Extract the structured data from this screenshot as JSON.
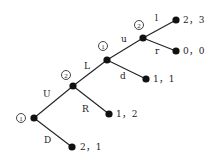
{
  "diagram": {
    "type": "extensive-form game tree",
    "nodes": [
      {
        "id": "n1",
        "player": "1",
        "x": 34,
        "y": 118
      },
      {
        "id": "n2",
        "player": "2",
        "x": 73,
        "y": 86
      },
      {
        "id": "n3",
        "player": "1",
        "x": 107,
        "y": 60
      },
      {
        "id": "n4",
        "player": "2",
        "x": 143,
        "y": 38
      }
    ],
    "terminals": [
      {
        "id": "t1",
        "x": 176,
        "y": 20,
        "payoff": "2，3"
      },
      {
        "id": "t2",
        "x": 176,
        "y": 51,
        "payoff": "0，0"
      },
      {
        "id": "t3",
        "x": 146,
        "y": 79,
        "payoff": "1，1"
      },
      {
        "id": "t4",
        "x": 109,
        "y": 114,
        "payoff": "1，2"
      },
      {
        "id": "t5",
        "x": 72,
        "y": 147,
        "payoff": "2，1"
      }
    ],
    "edges": [
      {
        "from": "n1",
        "to": "n2",
        "label": "U"
      },
      {
        "from": "n1",
        "to": "t5",
        "label": "D"
      },
      {
        "from": "n2",
        "to": "n3",
        "label": "L"
      },
      {
        "from": "n2",
        "to": "t4",
        "label": "R"
      },
      {
        "from": "n3",
        "to": "n4",
        "label": "u"
      },
      {
        "from": "n3",
        "to": "t3",
        "label": "d"
      },
      {
        "from": "n4",
        "to": "t1",
        "label": "l"
      },
      {
        "from": "n4",
        "to": "t2",
        "label": "r"
      }
    ],
    "player_labels": {
      "n1": "1",
      "n2": "2",
      "n3": "1",
      "n4": "2"
    },
    "edge_labels": {
      "U": "U",
      "D": "D",
      "L": "L",
      "R": "R",
      "u": "u",
      "d": "d",
      "l": "l",
      "r": "r"
    },
    "payoffs": {
      "t1": "2，3",
      "t2": "0，0",
      "t3": "1，1",
      "t4": "1，2",
      "t5": "2，1"
    }
  }
}
